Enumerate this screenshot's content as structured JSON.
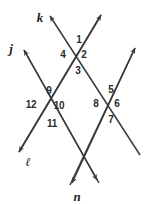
{
  "figure": {
    "background_color": "#ffffff",
    "stroke_color": "#3a3a3a",
    "label_color": "#2b2b2b"
  },
  "lines": [
    {
      "name": "k",
      "label": "k",
      "label_position": {
        "x": 40,
        "y": 17
      },
      "arrow_start": {
        "x": 48,
        "y": 14
      },
      "arrow_end": {
        "x": 140,
        "y": 155
      }
    },
    {
      "name": "j",
      "label": "j",
      "label_position": {
        "x": 11,
        "y": 48
      },
      "arrow_start": {
        "x": 22,
        "y": 48
      },
      "arrow_end": {
        "x": 99,
        "y": 183
      }
    },
    {
      "name": "l",
      "label": "ℓ",
      "label_position": {
        "x": 28,
        "y": 162
      },
      "arrow_start": {
        "x": 103,
        "y": 12
      },
      "arrow_end": {
        "x": 17,
        "y": 155
      }
    },
    {
      "name": "n",
      "label": "n",
      "label_position": {
        "x": 77,
        "y": 196
      },
      "arrow_start": {
        "x": 137,
        "y": 45
      },
      "arrow_end": {
        "x": 70,
        "y": 186
      }
    }
  ],
  "intersections": [
    {
      "name": "top-intersection",
      "point": {
        "x": 73,
        "y": 52
      },
      "lines": [
        "k",
        "l"
      ],
      "angles": [
        {
          "label": "1",
          "x": 79,
          "y": 40
        },
        {
          "label": "2",
          "x": 84,
          "y": 55
        },
        {
          "label": "3",
          "x": 78,
          "y": 71
        },
        {
          "label": "4",
          "x": 63,
          "y": 55
        }
      ]
    },
    {
      "name": "left-intersection",
      "point": {
        "x": 45,
        "y": 105
      },
      "lines": [
        "j",
        "l"
      ],
      "angles": [
        {
          "label": "9",
          "x": 49,
          "y": 91
        },
        {
          "label": "10",
          "x": 59,
          "y": 106
        },
        {
          "label": "11",
          "x": 52,
          "y": 124
        },
        {
          "label": "12",
          "x": 31,
          "y": 105
        }
      ]
    },
    {
      "name": "right-intersection",
      "point": {
        "x": 106,
        "y": 103
      },
      "lines": [
        "k",
        "n"
      ],
      "angles": [
        {
          "label": "5",
          "x": 111,
          "y": 90
        },
        {
          "label": "6",
          "x": 117,
          "y": 104
        },
        {
          "label": "7",
          "x": 111,
          "y": 120
        },
        {
          "label": "8",
          "x": 96,
          "y": 104
        }
      ]
    },
    {
      "name": "bottom-intersection",
      "point": {
        "x": 76,
        "y": 150
      },
      "lines": [
        "j",
        "n"
      ],
      "angles": []
    }
  ],
  "angle_numbers": [
    "1",
    "2",
    "3",
    "4",
    "5",
    "6",
    "7",
    "8",
    "9",
    "10",
    "11",
    "12"
  ]
}
